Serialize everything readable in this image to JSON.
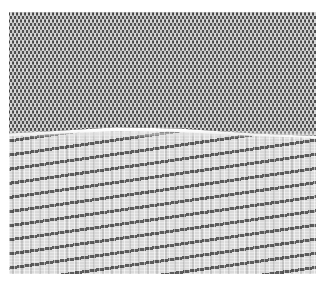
{
  "image": {
    "description": "Close-up photograph of knitted fabric showing two textures",
    "sections": [
      {
        "name": "upper",
        "label": "dark knit with light stitch pattern",
        "base_color": "#4f4f4f",
        "stitch_color": "#d0d0d0"
      },
      {
        "name": "lower",
        "label": "light weave with wavy dark diagonal bands",
        "base_color": "#dadada",
        "band_color": "#5c5c5c"
      }
    ],
    "background_color": "#ffffff"
  }
}
